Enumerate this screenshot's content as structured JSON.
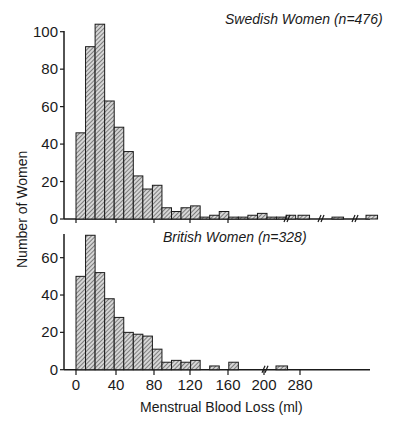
{
  "chart_data": [
    {
      "type": "bar",
      "title": "Swedish Women (n=476)",
      "xlabel": "Menstrual Blood Loss (ml)",
      "ylabel": "Number of Women",
      "bin_width": 10,
      "bin_starts": [
        0,
        10,
        20,
        30,
        40,
        50,
        60,
        70,
        80,
        90,
        100,
        110,
        120,
        130,
        140,
        150,
        160,
        170,
        180,
        190,
        200,
        210,
        220
      ],
      "values": [
        46,
        92,
        104,
        63,
        49,
        36,
        23,
        16,
        18,
        6,
        4,
        6,
        7,
        1,
        2,
        4,
        1,
        1,
        2,
        3,
        1,
        1,
        2
      ],
      "broken_axis_tail": [
        2,
        1,
        2
      ],
      "yticks": [
        0,
        20,
        40,
        60,
        80,
        100
      ],
      "ylim": [
        0,
        105
      ],
      "grid": false,
      "legend": null
    },
    {
      "type": "bar",
      "title": "British Women (n=328)",
      "xlabel": "Menstrual Blood Loss (ml)",
      "ylabel": "Number of Women",
      "bin_width": 10,
      "bin_starts": [
        0,
        10,
        20,
        30,
        40,
        50,
        60,
        70,
        80,
        90,
        100,
        110,
        120,
        130,
        140,
        150,
        160,
        170,
        180,
        190,
        200
      ],
      "values": [
        50,
        72,
        52,
        38,
        28,
        20,
        19,
        18,
        11,
        4,
        5,
        4,
        5,
        0,
        2,
        0,
        4,
        0,
        0,
        0,
        0
      ],
      "broken_axis_tail": [
        2
      ],
      "yticks": [
        0,
        20,
        40,
        60
      ],
      "ylim": [
        0,
        75
      ],
      "grid": false,
      "legend": null
    }
  ],
  "xticks": [
    "0",
    "40",
    "80",
    "120",
    "160",
    "200",
    "280"
  ],
  "labels": {
    "top_title": "Swedish Women (n=476)",
    "bottom_title": "British Women (n=328)",
    "ylabel": "Number of Women",
    "xlabel": "Menstrual Blood Loss (ml)"
  },
  "colors": {
    "ink": "#1a1a1a",
    "bar_fill": "#bdbdbd",
    "background": "#ffffff"
  }
}
